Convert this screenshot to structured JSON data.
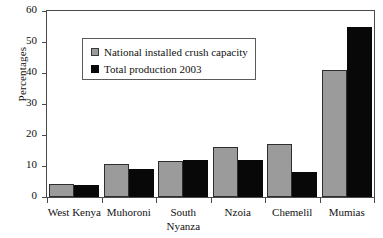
{
  "chart_data": {
    "type": "bar",
    "title": "",
    "xlabel": "",
    "ylabel": "Percentages",
    "ylim": [
      0,
      60
    ],
    "ytick_step": 10,
    "yticks": [
      "60",
      "50",
      "40",
      "30",
      "20",
      "10",
      "0"
    ],
    "grid": false,
    "legend_position": "upper-left-inside",
    "categories": [
      "West Kenya",
      "Muhoroni",
      "South Nyanza",
      "Nzoia",
      "Chemelil",
      "Mumias"
    ],
    "category_lines": [
      [
        "West Kenya"
      ],
      [
        "Muhoroni"
      ],
      [
        "South",
        "Nyanza"
      ],
      [
        "Nzoia"
      ],
      [
        "Chemelil"
      ],
      [
        "Mumias"
      ]
    ],
    "series": [
      {
        "name": "National installed crush capacity",
        "color": "#9b9b9b",
        "values": [
          4.2,
          10.5,
          11.5,
          16.0,
          17.0,
          41.0
        ]
      },
      {
        "name": "Total production 2003",
        "color": "#080808",
        "values": [
          4.0,
          9.0,
          12.0,
          12.0,
          8.0,
          55.0
        ]
      }
    ]
  },
  "legend": {
    "items": [
      {
        "label": "National installed crush capacity",
        "swatch": "gray-swatch-icon"
      },
      {
        "label": "Total production 2003",
        "swatch": "black-swatch-icon"
      }
    ]
  }
}
